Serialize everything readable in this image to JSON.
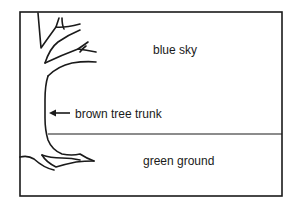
{
  "diagram": {
    "type": "labeled scene sketch",
    "regions": [
      {
        "id": "sky",
        "label": "blue sky"
      },
      {
        "id": "ground",
        "label": "green ground"
      }
    ],
    "callouts": [
      {
        "id": "trunk",
        "label": "brown tree trunk",
        "pointer": "arrow-left"
      }
    ],
    "colors": {
      "stroke": "#1a1a1a",
      "background": "#ffffff"
    }
  }
}
